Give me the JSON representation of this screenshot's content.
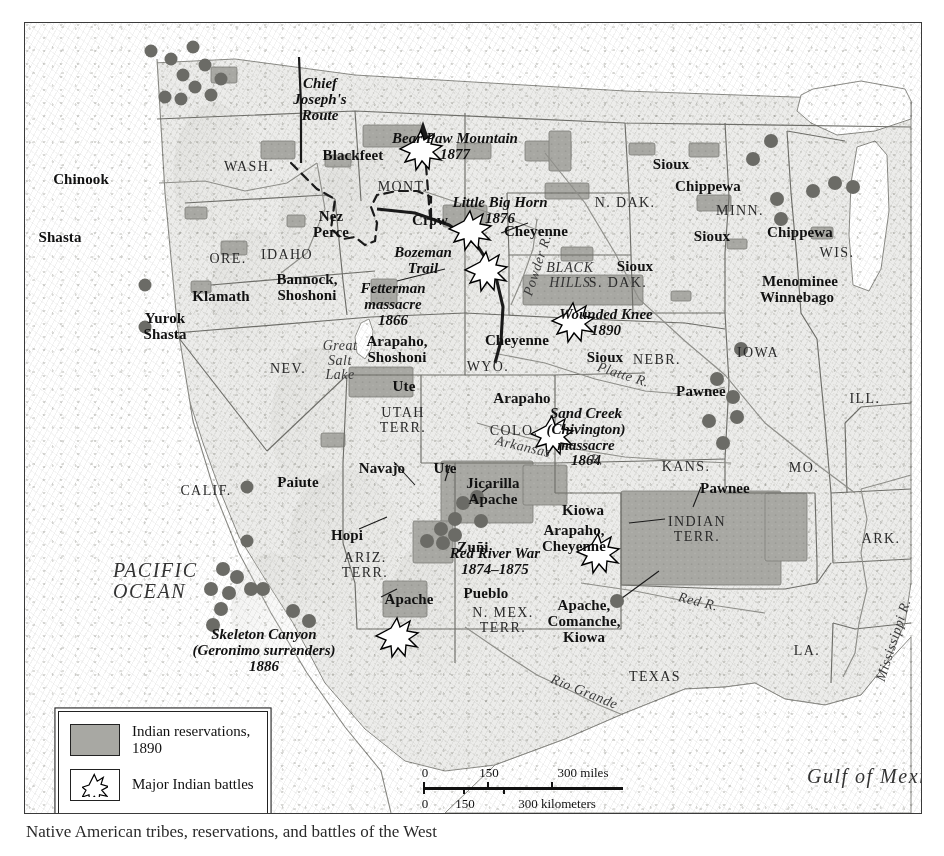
{
  "map": {
    "title": "Indian reservations and major Indian battles of the American West, 1890",
    "accent_colors": {
      "reservation_fill": "#a8a8a3",
      "land_fill": "#ececea",
      "water_fill": "#ffffff",
      "border_line": "#3a3a3a",
      "text": "#111111"
    }
  },
  "legend": {
    "items": [
      {
        "swatch": "reservation-swatch",
        "label": "Indian reservations,\n1890"
      },
      {
        "swatch": "battle-star-swatch",
        "label": "Major Indian\nbattles"
      }
    ]
  },
  "scale": {
    "miles_label": "300 miles",
    "miles_ticks": [
      "0",
      "150",
      "300 miles"
    ],
    "km_ticks": [
      "0",
      "150",
      "300 kilometers"
    ],
    "miles": [
      "0",
      "150"
    ],
    "kilometers": [
      "0",
      "150",
      "300 kilometers"
    ]
  },
  "oceans": [
    {
      "name": "PACIFIC\nOCEAN",
      "x": 88,
      "y": 537
    },
    {
      "name": "Gulf of Mexico",
      "x": 782,
      "y": 743
    }
  ],
  "states": [
    {
      "name": "WASH.",
      "x": 224,
      "y": 137
    },
    {
      "name": "ORE.",
      "x": 203,
      "y": 229
    },
    {
      "name": "IDAHO",
      "x": 262,
      "y": 225
    },
    {
      "name": "MONT.",
      "x": 378,
      "y": 157
    },
    {
      "name": "N. DAK.",
      "x": 600,
      "y": 173
    },
    {
      "name": "MINN.",
      "x": 715,
      "y": 181
    },
    {
      "name": "WIS.",
      "x": 812,
      "y": 223
    },
    {
      "name": "S. DAK.",
      "x": 593,
      "y": 253
    },
    {
      "name": "NEV.",
      "x": 263,
      "y": 339
    },
    {
      "name": "UTAH\nTERR.",
      "x": 378,
      "y": 383
    },
    {
      "name": "WYO.",
      "x": 463,
      "y": 337
    },
    {
      "name": "COLO.",
      "x": 489,
      "y": 401
    },
    {
      "name": "NEBR.",
      "x": 632,
      "y": 330
    },
    {
      "name": "KANS.",
      "x": 661,
      "y": 437
    },
    {
      "name": "IOWA",
      "x": 733,
      "y": 323
    },
    {
      "name": "ILL.",
      "x": 840,
      "y": 369
    },
    {
      "name": "MO.",
      "x": 779,
      "y": 438
    },
    {
      "name": "ARK.",
      "x": 856,
      "y": 509
    },
    {
      "name": "LA.",
      "x": 782,
      "y": 621
    },
    {
      "name": "CALIF.",
      "x": 181,
      "y": 461
    },
    {
      "name": "ARIZ.\nTERR.",
      "x": 340,
      "y": 528
    },
    {
      "name": "N. MEX.\nTERR.",
      "x": 478,
      "y": 583
    },
    {
      "name": "INDIAN\nTERR.",
      "x": 672,
      "y": 492
    },
    {
      "name": "TEXAS",
      "x": 630,
      "y": 647
    }
  ],
  "tribes": [
    {
      "name": "Chinook",
      "x": 56,
      "y": 149
    },
    {
      "name": "Shasta",
      "x": 35,
      "y": 207
    },
    {
      "name": "Klamath",
      "x": 196,
      "y": 266
    },
    {
      "name": "Yurok\nShasta",
      "x": 140,
      "y": 288
    },
    {
      "name": "Nez\nPerce",
      "x": 306,
      "y": 186
    },
    {
      "name": "Bannock,\nShoshoni",
      "x": 282,
      "y": 249
    },
    {
      "name": "Blackfeet",
      "x": 328,
      "y": 125
    },
    {
      "name": "Crow",
      "x": 405,
      "y": 190
    },
    {
      "name": "Cheyenne",
      "x": 511,
      "y": 201
    },
    {
      "name": "Sioux",
      "x": 646,
      "y": 134
    },
    {
      "name": "Sioux",
      "x": 610,
      "y": 236
    },
    {
      "name": "Sioux",
      "x": 687,
      "y": 206
    },
    {
      "name": "Sioux",
      "x": 580,
      "y": 327
    },
    {
      "name": "Chippewa",
      "x": 683,
      "y": 156
    },
    {
      "name": "Chippewa",
      "x": 775,
      "y": 202
    },
    {
      "name": "Menominee",
      "x": 775,
      "y": 251
    },
    {
      "name": "Winnebago",
      "x": 772,
      "y": 267
    },
    {
      "name": "Arapaho,\nShoshoni",
      "x": 372,
      "y": 311
    },
    {
      "name": "Cheyenne",
      "x": 492,
      "y": 310
    },
    {
      "name": "Ute",
      "x": 379,
      "y": 356
    },
    {
      "name": "Ute",
      "x": 420,
      "y": 438
    },
    {
      "name": "Arapaho",
      "x": 497,
      "y": 368
    },
    {
      "name": "Pawnee",
      "x": 676,
      "y": 361
    },
    {
      "name": "Pawnee",
      "x": 700,
      "y": 458
    },
    {
      "name": "Paiute",
      "x": 273,
      "y": 452
    },
    {
      "name": "Navajo",
      "x": 357,
      "y": 438
    },
    {
      "name": "Hopi",
      "x": 322,
      "y": 505
    },
    {
      "name": "Zuñi",
      "x": 448,
      "y": 517
    },
    {
      "name": "Apache",
      "x": 384,
      "y": 569
    },
    {
      "name": "Pueblo",
      "x": 461,
      "y": 563
    },
    {
      "name": "Jicarilla\nApache",
      "x": 468,
      "y": 453
    },
    {
      "name": "Kiowa",
      "x": 558,
      "y": 480
    },
    {
      "name": "Arapaho,\nCheyenne",
      "x": 549,
      "y": 500
    },
    {
      "name": "Apache,\nComanche,\nKiowa",
      "x": 559,
      "y": 575
    }
  ],
  "battles": [
    {
      "name": "Bear Paw Mountain\n1877",
      "x": 430,
      "y": 108,
      "star_x": 414,
      "star_y": 126
    },
    {
      "name": "Little Big Horn\n1876",
      "x": 475,
      "y": 172,
      "star_x": 463,
      "star_y": 206
    },
    {
      "name": "Fetterman\nmassacre\n1866",
      "x": 368,
      "y": 258,
      "star_x": 479,
      "star_y": 247
    },
    {
      "name": "Wounded Knee\n1890",
      "x": 581,
      "y": 284,
      "star_x": 566,
      "star_y": 298
    },
    {
      "name": "Sand Creek\n(Chivington)\nmassacre\n1864",
      "x": 561,
      "y": 383,
      "star_x": 545,
      "star_y": 411
    },
    {
      "name": "Red River War\n1874–1875",
      "x": 470,
      "y": 523,
      "star_x": 591,
      "star_y": 529
    },
    {
      "name": "Skeleton Canyon\n(Geronimo surrenders)\n1886",
      "x": 239,
      "y": 604,
      "star_x": 390,
      "star_y": 613
    }
  ],
  "routes": [
    {
      "name": "Chief\nJoseph's\nRoute",
      "x": 295,
      "y": 53
    },
    {
      "name": "Bozeman\nTrail",
      "x": 398,
      "y": 222
    }
  ],
  "waters": [
    {
      "name": "Powder R.",
      "x": 513,
      "y": 235,
      "rot": -72
    },
    {
      "name": "Platte R.",
      "x": 598,
      "y": 345,
      "rot": 18
    },
    {
      "name": "Arkansas",
      "x": 498,
      "y": 417,
      "rot": 13
    },
    {
      "name": "R.",
      "x": 572,
      "y": 430,
      "rot": 8
    },
    {
      "name": "Red R.",
      "x": 673,
      "y": 572,
      "rot": 14
    },
    {
      "name": "Rio Grande",
      "x": 559,
      "y": 662,
      "rot": 22
    },
    {
      "name": "Mississippi R.",
      "x": 869,
      "y": 610,
      "rot": -72
    },
    {
      "name": "Great\nSalt\nLake",
      "x": 315,
      "y": 316,
      "rot": 0
    }
  ],
  "physiographic": [
    {
      "name": "BLACK\nHILLS",
      "x": 545,
      "y": 238
    }
  ],
  "caption": {
    "text": "Native American tribes, reservations, and battles of the West"
  }
}
